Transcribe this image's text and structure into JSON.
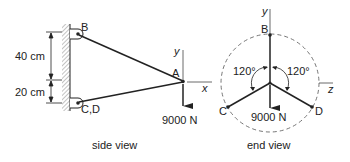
{
  "side_view": {
    "caption": "side view",
    "points": {
      "B": "B",
      "CD": "C,D",
      "A": "A"
    },
    "dimensions": {
      "upper": "40 cm",
      "lower": "20 cm"
    },
    "axes": {
      "y": "y",
      "x": "x"
    },
    "load": "9000 N"
  },
  "end_view": {
    "caption": "end view",
    "points": {
      "B": "B",
      "C": "C",
      "D": "D"
    },
    "angles": {
      "left": "120°",
      "right": "120°"
    },
    "axes": {
      "y": "y",
      "z": "z"
    },
    "load": "9000 N"
  },
  "colors": {
    "line": "#222222",
    "hatch": "#777777",
    "dashed": "#666666"
  }
}
